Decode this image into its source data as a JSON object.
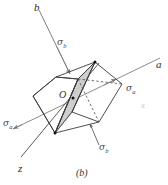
{
  "figure": {
    "caption": "(b)",
    "axes": [
      {
        "name": "b",
        "label": "b",
        "position": "top-left"
      },
      {
        "name": "a",
        "label": "a",
        "position": "right"
      },
      {
        "name": "z",
        "label": "z",
        "position": "bottom-left"
      },
      {
        "name": "x",
        "label": "x",
        "position": "mid-right-faint"
      }
    ],
    "point_label": "O",
    "stress_labels": [
      {
        "name": "sigma-b-top",
        "sigma": "σ",
        "subscript": "b"
      },
      {
        "name": "sigma-a-right",
        "sigma": "σ",
        "subscript": "a"
      },
      {
        "name": "sigma-a-left",
        "sigma": "σ",
        "subscript": "a"
      },
      {
        "name": "sigma-b-bottom",
        "sigma": "σ",
        "subscript": "b"
      }
    ],
    "colors": {
      "line": "#3a3a3a",
      "axis_line": "#6b6b6b",
      "shaded_plane": "#cfcfcf",
      "shaded_plane_dark": "#b8b8b8",
      "background": "#ffffff",
      "faint_text": "#c9c9c9"
    }
  }
}
